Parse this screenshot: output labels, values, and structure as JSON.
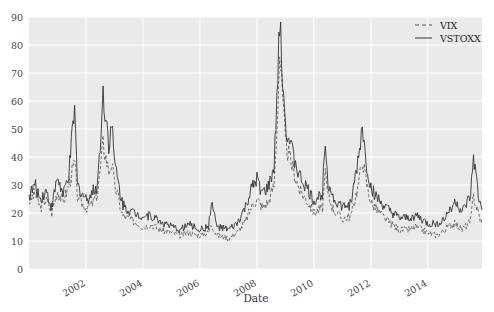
{
  "chart_data": {
    "type": "line",
    "title": "",
    "xlabel": "Date",
    "ylabel": "",
    "xlim": [
      2000.0,
      2015.9
    ],
    "ylim": [
      0,
      90
    ],
    "grid": true,
    "legend_position": "upper right",
    "x_ticks": [
      "2002",
      "2004",
      "2006",
      "2008",
      "2010",
      "2012",
      "2014"
    ],
    "x_tick_values": [
      2002,
      2004,
      2006,
      2008,
      2010,
      2012,
      2014
    ],
    "y_ticks": [
      "0",
      "10",
      "20",
      "30",
      "40",
      "50",
      "60",
      "70",
      "80",
      "90"
    ],
    "y_tick_values": [
      0,
      10,
      20,
      30,
      40,
      50,
      60,
      70,
      80,
      90
    ],
    "x": [
      2000.0,
      2000.2,
      2000.4,
      2000.6,
      2000.8,
      2001.0,
      2001.2,
      2001.4,
      2001.6,
      2001.7,
      2001.8,
      2002.0,
      2002.2,
      2002.4,
      2002.5,
      2002.6,
      2002.7,
      2002.8,
      2002.9,
      2003.0,
      2003.1,
      2003.2,
      2003.3,
      2003.5,
      2003.7,
      2004.0,
      2004.3,
      2004.6,
      2005.0,
      2005.3,
      2005.6,
      2006.0,
      2006.3,
      2006.4,
      2006.6,
      2007.0,
      2007.3,
      2007.6,
      2007.8,
      2008.0,
      2008.2,
      2008.4,
      2008.6,
      2008.7,
      2008.8,
      2008.9,
      2009.0,
      2009.2,
      2009.5,
      2009.8,
      2010.0,
      2010.3,
      2010.4,
      2010.5,
      2010.7,
      2011.0,
      2011.3,
      2011.6,
      2011.7,
      2011.8,
      2012.0,
      2012.3,
      2012.6,
      2013.0,
      2013.3,
      2013.6,
      2014.0,
      2014.3,
      2014.6,
      2014.8,
      2015.0,
      2015.2,
      2015.5,
      2015.6,
      2015.8,
      2015.9
    ],
    "series": [
      {
        "name": "VIX",
        "style": "dashed",
        "values": [
          24,
          27,
          22,
          25,
          20,
          28,
          24,
          30,
          38,
          26,
          24,
          22,
          23,
          27,
          35,
          45,
          40,
          35,
          38,
          30,
          27,
          22,
          19,
          18,
          17,
          15,
          16,
          14,
          13,
          12,
          13,
          12,
          13,
          16,
          12,
          11,
          13,
          17,
          22,
          25,
          22,
          24,
          30,
          50,
          78,
          60,
          45,
          38,
          28,
          24,
          20,
          22,
          33,
          26,
          21,
          18,
          19,
          32,
          40,
          33,
          24,
          20,
          17,
          14,
          14,
          15,
          13,
          12,
          14,
          16,
          16,
          14,
          17,
          26,
          19,
          16
        ]
      },
      {
        "name": "VSTOXX",
        "style": "solid",
        "values": [
          26,
          30,
          25,
          28,
          22,
          33,
          26,
          34,
          57,
          30,
          28,
          25,
          27,
          30,
          45,
          62,
          55,
          45,
          52,
          38,
          33,
          27,
          23,
          21,
          20,
          19,
          19,
          17,
          15,
          14,
          16,
          14,
          15,
          24,
          15,
          14,
          16,
          22,
          28,
          32,
          27,
          29,
          36,
          60,
          87,
          70,
          52,
          43,
          33,
          28,
          24,
          27,
          48,
          31,
          25,
          22,
          23,
          42,
          52,
          40,
          29,
          24,
          21,
          18,
          18,
          19,
          16,
          16,
          18,
          22,
          24,
          20,
          26,
          40,
          24,
          21
        ]
      }
    ]
  }
}
